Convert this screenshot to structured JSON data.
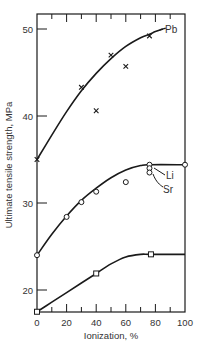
{
  "chart_data": {
    "type": "line",
    "title": "",
    "xlabel": "Ionization, %",
    "ylabel": "Ultimate tensile strength, MPa",
    "xlim": [
      0,
      100
    ],
    "ylim": [
      17.5,
      51.5
    ],
    "x_ticks": [
      0,
      20,
      40,
      60,
      80,
      100
    ],
    "y_ticks": [
      20,
      30,
      40,
      50
    ],
    "grid": false,
    "legend_position": "inline labels",
    "series": [
      {
        "name": "Pb",
        "marker": "x",
        "points": [
          [
            0,
            35.0
          ],
          [
            30,
            43.3
          ],
          [
            40,
            40.6
          ],
          [
            50,
            47.0
          ],
          [
            60,
            45.7
          ],
          [
            76,
            49.2
          ]
        ],
        "curve": [
          [
            0,
            35.0
          ],
          [
            10,
            37.8
          ],
          [
            20,
            40.5
          ],
          [
            30,
            42.9
          ],
          [
            40,
            44.9
          ],
          [
            50,
            46.6
          ],
          [
            60,
            48.0
          ],
          [
            70,
            49.0
          ],
          [
            76,
            49.4
          ],
          [
            80,
            49.7
          ],
          [
            85,
            50.0
          ]
        ]
      },
      {
        "name": "Li/Sr",
        "marker": "o",
        "points": [
          [
            0,
            24.0
          ],
          [
            20,
            28.4
          ],
          [
            30,
            30.1
          ],
          [
            40,
            31.3
          ],
          [
            60,
            32.4
          ],
          [
            76,
            34.4
          ],
          [
            100,
            34.4
          ]
        ],
        "curve": [
          [
            0,
            24.0
          ],
          [
            10,
            26.4
          ],
          [
            20,
            28.5
          ],
          [
            30,
            30.3
          ],
          [
            40,
            31.7
          ],
          [
            50,
            32.9
          ],
          [
            60,
            33.8
          ],
          [
            70,
            34.3
          ],
          [
            76,
            34.4
          ],
          [
            100,
            34.4
          ]
        ]
      },
      {
        "name": "Li",
        "marker": "o",
        "points": [
          [
            76,
            34.0
          ]
        ]
      },
      {
        "name": "Sr",
        "marker": "o",
        "points": [
          [
            76,
            33.5
          ]
        ]
      },
      {
        "name": "unlabeled",
        "marker": "square",
        "points": [
          [
            0,
            17.5
          ],
          [
            40,
            21.9
          ],
          [
            77,
            24.1
          ]
        ],
        "curve": [
          [
            0,
            17.5
          ],
          [
            10,
            18.6
          ],
          [
            20,
            19.7
          ],
          [
            30,
            20.8
          ],
          [
            40,
            21.9
          ],
          [
            50,
            23.0
          ],
          [
            60,
            23.8
          ],
          [
            70,
            24.1
          ],
          [
            77,
            24.1
          ],
          [
            100,
            24.1
          ]
        ]
      }
    ],
    "annotations": [
      {
        "text": "Pb",
        "x": 87,
        "y": 50.0
      },
      {
        "text": "Li",
        "x": 82,
        "y": 33.6
      },
      {
        "text": "Sr",
        "x": 84,
        "y": 31.9
      }
    ]
  },
  "labels": {
    "xlabel": "Ionization, %",
    "ylabel": "Ultimate tensile strength, MPa",
    "pb": "Pb",
    "li": "Li",
    "sr": "Sr"
  },
  "colors": {
    "ink": "#1a1a1a",
    "text": "#333333",
    "background": "#ffffff"
  }
}
